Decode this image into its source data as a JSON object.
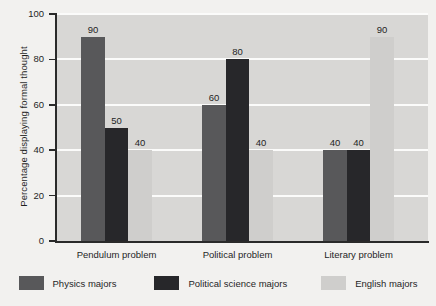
{
  "chart_data": {
    "type": "bar",
    "title": "",
    "xlabel": "",
    "ylabel": "Percentage displaying formal thought",
    "ylim": [
      0,
      100
    ],
    "yticks": [
      0,
      20,
      40,
      60,
      80,
      100
    ],
    "grid": true,
    "legend_position": "bottom",
    "categories": [
      "Pendulum problem",
      "Political problem",
      "Literary problem"
    ],
    "series": [
      {
        "name": "Physics majors",
        "color": "#58585a",
        "values": [
          90,
          60,
          40
        ]
      },
      {
        "name": "Political science majors",
        "color": "#27272a",
        "values": [
          50,
          80,
          40
        ]
      },
      {
        "name": "English majors",
        "color": "#cfcecc",
        "values": [
          40,
          40,
          90
        ]
      }
    ]
  },
  "plot": {
    "background_color": "#d8d7d5",
    "gridline_color": "#fbfbfa",
    "axis_color": "#2a2a2a",
    "page_background": "#f2f1ef"
  }
}
